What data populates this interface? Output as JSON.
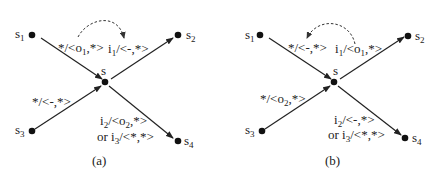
{
  "panels": [
    {
      "caption": "(a)",
      "nodes": {
        "s1": {
          "name": "s",
          "sub": "1"
        },
        "s2": {
          "name": "s",
          "sub": "2"
        },
        "s3": {
          "name": "s",
          "sub": "3"
        },
        "s4": {
          "name": "s",
          "sub": "4"
        },
        "s": {
          "name": "s"
        }
      },
      "edges": {
        "s1_s": {
          "pre": "*/<o",
          "sub": "1",
          "post": ",*>"
        },
        "s_s2": {
          "pre": "i",
          "sub": "1",
          "post": "/<-,*>"
        },
        "s3_s": {
          "pre": "*/<-,*>"
        },
        "s_s4_line1": {
          "pre": "i",
          "sub": "2",
          "mid": "/<o",
          "sub2": "2",
          "post": ",*>"
        },
        "s_s4_line2": {
          "pre": "or i",
          "sub": "3",
          "post": "/<*,*>"
        }
      }
    },
    {
      "caption": "(b)",
      "nodes": {
        "s1": {
          "name": "s",
          "sub": "1"
        },
        "s2": {
          "name": "s",
          "sub": "2"
        },
        "s3": {
          "name": "s",
          "sub": "3"
        },
        "s4": {
          "name": "s",
          "sub": "4"
        },
        "s": {
          "name": "s"
        }
      },
      "edges": {
        "s1_s": {
          "pre": "*/<-,*>"
        },
        "s_s2": {
          "pre": "i",
          "sub": "1",
          "mid": "/<o",
          "sub2": "1",
          "post": ",*>"
        },
        "s3_s": {
          "pre": "*/<o",
          "sub": "2",
          "post": ",*>"
        },
        "s_s4_line1": {
          "pre": "i",
          "sub": "2",
          "post": "/<-,*>"
        },
        "s_s4_line2": {
          "pre": "or i",
          "sub": "3",
          "post": "/<*,*>"
        }
      }
    }
  ],
  "colors": {
    "ink": "#222222",
    "background": "#ffffff"
  }
}
